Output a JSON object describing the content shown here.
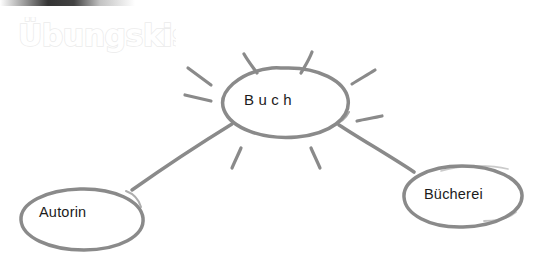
{
  "canvas": {
    "width": 541,
    "height": 263,
    "background_color": "#ffffff",
    "stroke_color": "#8a8a8a",
    "text_color": "#1c1c1c"
  },
  "watermark": {
    "text": "Übungskiste",
    "color": "#ececec"
  },
  "diagram": {
    "type": "mindmap",
    "title": "Buch",
    "nodes": [
      {
        "id": "buch",
        "label": "Buch",
        "shape": "ellipse",
        "role": "central",
        "cx": 285,
        "cy": 102,
        "rx": 63,
        "ry": 35,
        "has_rays": true
      },
      {
        "id": "autorin",
        "label": "Autorin",
        "shape": "ellipse",
        "role": "leaf",
        "cx": 82,
        "cy": 219,
        "rx": 62,
        "ry": 31,
        "has_rays": false
      },
      {
        "id": "buecherei",
        "label": "Bücherei",
        "shape": "ellipse",
        "role": "leaf",
        "cx": 463,
        "cy": 196,
        "rx": 59,
        "ry": 31,
        "has_rays": false
      }
    ],
    "edges": [
      {
        "id": "edge-buch-autorin",
        "from": "buch",
        "to": "autorin"
      },
      {
        "id": "edge-buch-buecherei",
        "from": "buch",
        "to": "buecherei"
      }
    ],
    "ray_count": 8
  }
}
